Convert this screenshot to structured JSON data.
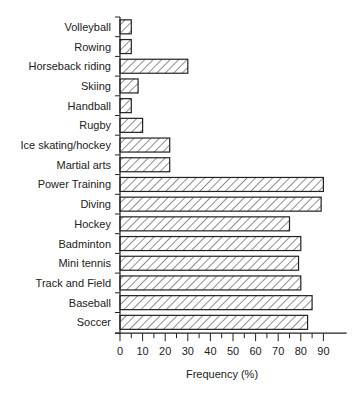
{
  "chart_data": {
    "type": "bar",
    "orientation": "horizontal",
    "title": "",
    "xlabel": "Frequency (%)",
    "ylabel": "",
    "xlim": [
      0,
      95
    ],
    "xticks": [
      0,
      10,
      20,
      30,
      40,
      50,
      60,
      70,
      80,
      90
    ],
    "grid": false,
    "legend": null,
    "bar_style": "diagonal hatch, black outline, white fill",
    "categories": [
      "Volleyball",
      "Rowing",
      "Horseback riding",
      "Skiing",
      "Handball",
      "Rugby",
      "Ice skating/hockey",
      "Martial arts",
      "Power Training",
      "Diving",
      "Hockey",
      "Badminton",
      "Mini tennis",
      "Track and Field",
      "Baseball",
      "Soccer"
    ],
    "values": [
      5,
      5,
      30,
      8,
      5,
      10,
      22,
      22,
      90,
      89,
      75,
      80,
      79,
      80,
      85,
      83
    ]
  }
}
